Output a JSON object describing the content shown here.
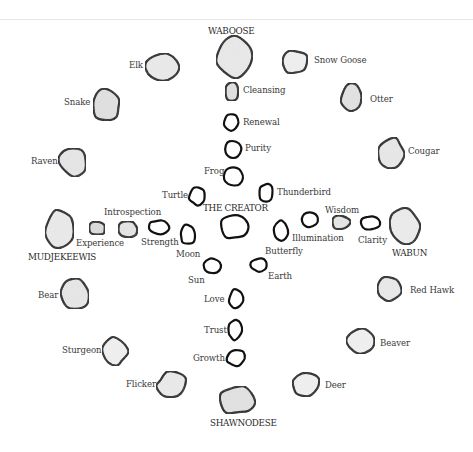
{
  "diagram": {
    "type": "medicine-wheel",
    "center_label": "THE CREATOR",
    "directions": [
      {
        "id": "waboose",
        "label": "WABOOSE",
        "cx": 234,
        "cy": 57,
        "rx": 17,
        "ry": 20,
        "shade": "#ebebeb",
        "lx": 208,
        "ly": 27
      },
      {
        "id": "wabun",
        "label": "WABUN",
        "cx": 405,
        "cy": 226,
        "rx": 15,
        "ry": 19,
        "shade": "#eeeeee",
        "lx": 392,
        "ly": 249
      },
      {
        "id": "shawnodese",
        "label": "SHAWNODESE",
        "cx": 237,
        "cy": 400,
        "rx": 19,
        "ry": 14,
        "shade": "#e4e4e4",
        "lx": 210,
        "ly": 419
      },
      {
        "id": "mudjekeewis",
        "label": "MUDJEKEEWIS",
        "cx": 60,
        "cy": 229,
        "rx": 15,
        "ry": 19,
        "shade": "#ececec",
        "lx": 28,
        "ly": 253
      }
    ],
    "center": {
      "cx": 234,
      "cy": 227,
      "rx": 14,
      "ry": 12,
      "shade": "#ffffff",
      "lx": 203,
      "ly": 204
    },
    "spirit_keepers": [
      {
        "id": "cleansing",
        "label": "Cleansing",
        "cx": 232,
        "cy": 92,
        "rx": 7,
        "ry": 10,
        "shade": "#e2e2e2",
        "lx": 243,
        "ly": 86
      },
      {
        "id": "renewal",
        "label": "Renewal",
        "cx": 231,
        "cy": 122,
        "rx": 7,
        "ry": 9,
        "shade": "#ffffff",
        "lx": 243,
        "ly": 118
      },
      {
        "id": "purity",
        "label": "Purity",
        "cx": 233,
        "cy": 150,
        "rx": 8,
        "ry": 9,
        "shade": "#ffffff",
        "lx": 245,
        "ly": 144
      },
      {
        "id": "wisdom",
        "label": "Wisdom",
        "cx": 341,
        "cy": 222,
        "rx": 10,
        "ry": 7,
        "shade": "#e8e8e8",
        "lx": 325,
        "ly": 206
      },
      {
        "id": "clarity",
        "label": "Clarity",
        "cx": 371,
        "cy": 223,
        "rx": 10,
        "ry": 7,
        "shade": "#ffffff",
        "lx": 358,
        "ly": 236
      },
      {
        "id": "illumination",
        "label": "Illumination",
        "cx": 310,
        "cy": 220,
        "rx": 9,
        "ry": 7,
        "shade": "#ffffff",
        "lx": 292,
        "ly": 234
      },
      {
        "id": "love",
        "label": "Love",
        "cx": 236,
        "cy": 299,
        "rx": 7,
        "ry": 10,
        "shade": "#ffffff",
        "lx": 204,
        "ly": 295
      },
      {
        "id": "trust",
        "label": "Trust",
        "cx": 235,
        "cy": 330,
        "rx": 7,
        "ry": 10,
        "shade": "#ffffff",
        "lx": 204,
        "ly": 326
      },
      {
        "id": "growth",
        "label": "Growth",
        "cx": 236,
        "cy": 358,
        "rx": 9,
        "ry": 9,
        "shade": "#ffffff",
        "lx": 193,
        "ly": 354
      },
      {
        "id": "introspection",
        "label": "Introspection",
        "cx": 128,
        "cy": 229,
        "rx": 10,
        "ry": 8,
        "shade": "#e6e6e6",
        "lx": 104,
        "ly": 208
      },
      {
        "id": "experience",
        "label": "Experience",
        "cx": 97,
        "cy": 228,
        "rx": 9,
        "ry": 7,
        "shade": "#dcdcdc",
        "lx": 76,
        "ly": 239
      },
      {
        "id": "strength",
        "label": "Strength",
        "cx": 159,
        "cy": 227,
        "rx": 10,
        "ry": 7,
        "shade": "#ffffff",
        "lx": 141,
        "ly": 238
      }
    ],
    "inner_circle": [
      {
        "id": "frog",
        "label": "Frog",
        "cx": 233,
        "cy": 177,
        "rx": 10,
        "ry": 9,
        "shade": "#ffffff",
        "lx": 204,
        "ly": 167
      },
      {
        "id": "turtle",
        "label": "Turtle",
        "cx": 197,
        "cy": 196,
        "rx": 8,
        "ry": 9,
        "shade": "#ffffff",
        "lx": 162,
        "ly": 191
      },
      {
        "id": "thunderbird",
        "label": "Thunderbird",
        "cx": 266,
        "cy": 193,
        "rx": 7,
        "ry": 9,
        "shade": "#ffffff",
        "lx": 277,
        "ly": 188
      },
      {
        "id": "moon",
        "label": "Moon",
        "cx": 188,
        "cy": 235,
        "rx": 8,
        "ry": 10,
        "shade": "#ffffff",
        "lx": 176,
        "ly": 250
      },
      {
        "id": "butterfly",
        "label": "Butterfly",
        "cx": 281,
        "cy": 231,
        "rx": 7,
        "ry": 10,
        "shade": "#ffffff",
        "lx": 265,
        "ly": 247
      },
      {
        "id": "sun",
        "label": "Sun",
        "cx": 212,
        "cy": 266,
        "rx": 9,
        "ry": 8,
        "shade": "#ffffff",
        "lx": 188,
        "ly": 276
      },
      {
        "id": "earth",
        "label": "Earth",
        "cx": 259,
        "cy": 265,
        "rx": 8,
        "ry": 7,
        "shade": "#ffffff",
        "lx": 268,
        "ly": 272
      }
    ],
    "moons": [
      {
        "id": "snow-goose",
        "label": "Snow Goose",
        "cx": 295,
        "cy": 62,
        "rx": 13,
        "ry": 12,
        "shade": "#f2f2f2",
        "lx": 314,
        "ly": 56
      },
      {
        "id": "otter",
        "label": "Otter",
        "cx": 352,
        "cy": 97,
        "rx": 11,
        "ry": 14,
        "shade": "#e4e4e4",
        "lx": 370,
        "ly": 95
      },
      {
        "id": "cougar",
        "label": "Cougar",
        "cx": 391,
        "cy": 154,
        "rx": 13,
        "ry": 16,
        "shade": "#eaeaea",
        "lx": 408,
        "ly": 147
      },
      {
        "id": "red-hawk",
        "label": "Red Hawk",
        "cx": 389,
        "cy": 289,
        "rx": 13,
        "ry": 12,
        "shade": "#ebebeb",
        "lx": 410,
        "ly": 286
      },
      {
        "id": "beaver",
        "label": "Beaver",
        "cx": 361,
        "cy": 342,
        "rx": 14,
        "ry": 13,
        "shade": "#f3f3f3",
        "lx": 380,
        "ly": 339
      },
      {
        "id": "deer",
        "label": "Deer",
        "cx": 306,
        "cy": 384,
        "rx": 14,
        "ry": 12,
        "shade": "#f3f3f3",
        "lx": 325,
        "ly": 381
      },
      {
        "id": "flicker",
        "label": "Flicker",
        "cx": 172,
        "cy": 385,
        "rx": 15,
        "ry": 13,
        "shade": "#ececec",
        "lx": 126,
        "ly": 380
      },
      {
        "id": "sturgeon",
        "label": "Sturgeon",
        "cx": 115,
        "cy": 351,
        "rx": 13,
        "ry": 14,
        "shade": "#f3f3f3",
        "lx": 62,
        "ly": 346
      },
      {
        "id": "bear",
        "label": "Bear",
        "cx": 74,
        "cy": 294,
        "rx": 15,
        "ry": 16,
        "shade": "#e9e9e9",
        "lx": 38,
        "ly": 291
      },
      {
        "id": "raven",
        "label": "Raven",
        "cx": 73,
        "cy": 161,
        "rx": 14,
        "ry": 15,
        "shade": "#e8e8e8",
        "lx": 31,
        "ly": 157
      },
      {
        "id": "snake",
        "label": "Snake",
        "cx": 106,
        "cy": 105,
        "rx": 14,
        "ry": 16,
        "shade": "#e2e2e2",
        "lx": 64,
        "ly": 98
      },
      {
        "id": "elk",
        "label": "Elk",
        "cx": 162,
        "cy": 67,
        "rx": 16,
        "ry": 13,
        "shade": "#ececec",
        "lx": 129,
        "ly": 61
      }
    ]
  }
}
